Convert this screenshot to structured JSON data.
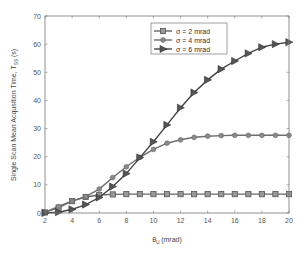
{
  "chart_data": {
    "type": "line",
    "title": "",
    "xlabel": "θ_U (mrad)",
    "xlabel_main": "θ",
    "xlabel_sub": "U",
    "xlabel_unit": "(mrad)",
    "ylabel": "Single Scan Mean Acqusition Time, T_SS (s)",
    "ylabel_main": "Single Scan Mean Acqusition Time, T",
    "ylabel_sub": "SS",
    "ylabel_unit": "(s)",
    "xlim": [
      2,
      20
    ],
    "ylim": [
      0,
      70
    ],
    "xticks": [
      2,
      4,
      6,
      8,
      10,
      12,
      14,
      16,
      18,
      20
    ],
    "yticks": [
      0,
      10,
      20,
      30,
      40,
      50,
      60,
      70
    ],
    "grid": false,
    "legend_position": "upper center",
    "x": [
      2,
      3,
      4,
      5,
      6,
      7,
      8,
      9,
      10,
      11,
      12,
      13,
      14,
      15,
      16,
      17,
      18,
      19,
      20
    ],
    "series": [
      {
        "name": "σ = 2 mrad",
        "marker": "square",
        "color": "#666666",
        "values": [
          0.2,
          1.9,
          4.2,
          5.7,
          6.4,
          6.6,
          6.7,
          6.7,
          6.7,
          6.7,
          6.7,
          6.7,
          6.7,
          6.7,
          6.7,
          6.7,
          6.7,
          6.7,
          6.7
        ]
      },
      {
        "name": "σ = 4 mrad",
        "marker": "circle",
        "color": "#6e6e6e",
        "values": [
          0.3,
          2.3,
          4.3,
          5.8,
          8.5,
          12.6,
          16.4,
          19.8,
          22.6,
          24.8,
          26.0,
          26.9,
          27.3,
          27.5,
          27.6,
          27.6,
          27.6,
          27.6,
          27.6
        ]
      },
      {
        "name": "σ = 6 mrad",
        "marker": "triangle-right",
        "color": "#444444",
        "values": [
          0.0,
          0.3,
          1.3,
          3.0,
          5.5,
          9.4,
          14.0,
          19.7,
          25.3,
          31.3,
          37.4,
          42.8,
          47.3,
          51.1,
          54.0,
          56.7,
          58.9,
          60.0,
          60.7
        ]
      }
    ]
  },
  "legend": {
    "items": [
      {
        "label": "σ = 2 mrad"
      },
      {
        "label": "σ = 4 mrad"
      },
      {
        "label": "σ = 6 mrad"
      }
    ]
  }
}
